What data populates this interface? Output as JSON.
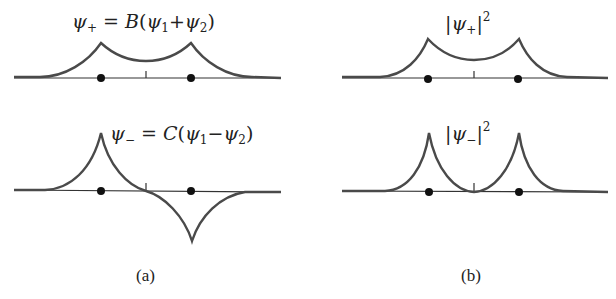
{
  "figure": {
    "panels": [
      {
        "id": "a-top",
        "column": "a",
        "row": "top",
        "equation": {
          "lhs": "ψ",
          "lhs_sub": "+",
          "eq": "=",
          "coef": "B",
          "open": "(",
          "t1": "ψ",
          "t1_sub": "1",
          "op": "+",
          "t2": "ψ",
          "t2_sub": "2",
          "close": ")"
        },
        "description": "symmetric combination: two cusps above axis"
      },
      {
        "id": "b-top",
        "column": "b",
        "row": "top",
        "equation": {
          "bar_l": "|",
          "lhs": "ψ",
          "lhs_sub": "+",
          "bar_r": "|",
          "pow": "2"
        },
        "description": "probability density of symmetric state"
      },
      {
        "id": "a-bottom",
        "column": "a",
        "row": "bottom",
        "equation": {
          "lhs": "ψ",
          "lhs_sub": "−",
          "eq": "=",
          "coef": "C",
          "open": "(",
          "t1": "ψ",
          "t1_sub": "1",
          "op": "−",
          "t2": "ψ",
          "t2_sub": "2",
          "close": ")"
        },
        "description": "antisymmetric combination: cusp up left, cusp down right"
      },
      {
        "id": "b-bottom",
        "column": "b",
        "row": "bottom",
        "equation": {
          "bar_l": "|",
          "lhs": "ψ",
          "lhs_sub": "−",
          "bar_r": "|",
          "pow": "2"
        },
        "description": "probability density of antisymmetric state, zero at midpoint"
      }
    ],
    "captions": {
      "a": "(a)",
      "b": "(b)"
    },
    "colors": {
      "curve": "#4a4a4a",
      "axis": "#333333",
      "dot": "#111111",
      "background": "#ffffff"
    }
  }
}
